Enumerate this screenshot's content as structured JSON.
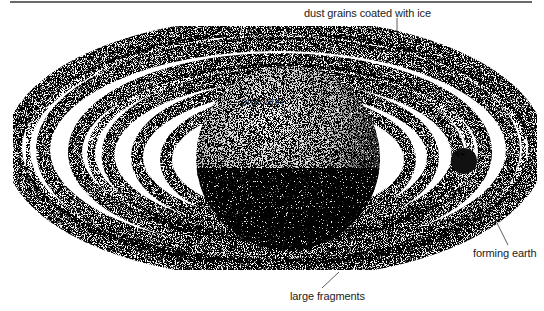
{
  "figure": {
    "style": "black stipple illustration",
    "colors": {
      "ink": "#111111",
      "background": "#ffffff",
      "rule": "#6a6a6a"
    }
  },
  "labels": {
    "dust": "dust grains coated with ice",
    "protosun": "protosun",
    "earth": "forming earth",
    "fragments": "large fragments"
  }
}
